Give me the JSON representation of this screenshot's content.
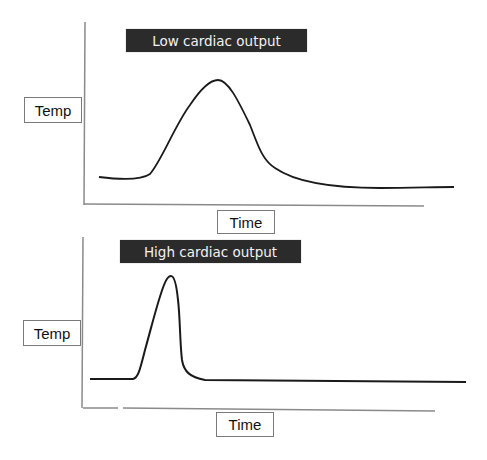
{
  "panels": [
    {
      "title": "Low cardiac output",
      "ylabel": "Temp",
      "xlabel": "Time",
      "curve": {
        "description": "broad, low, delayed thermodilution curve",
        "points": [
          [
            0.0,
            0.27
          ],
          [
            0.13,
            0.26
          ],
          [
            0.18,
            0.32
          ],
          [
            0.25,
            0.62
          ],
          [
            0.33,
            0.95
          ],
          [
            0.36,
            0.97
          ],
          [
            0.41,
            0.8
          ],
          [
            0.47,
            0.42
          ],
          [
            0.55,
            0.24
          ],
          [
            0.7,
            0.17
          ],
          [
            1.0,
            0.17
          ]
        ]
      }
    },
    {
      "title": "High cardiac output",
      "ylabel": "Temp",
      "xlabel": "Time",
      "curve": {
        "description": "narrow, tall, early thermodilution curve",
        "points": [
          [
            0.0,
            0.18
          ],
          [
            0.12,
            0.18
          ],
          [
            0.15,
            0.3
          ],
          [
            0.2,
            0.75
          ],
          [
            0.22,
            0.96
          ],
          [
            0.235,
            0.96
          ],
          [
            0.25,
            0.7
          ],
          [
            0.27,
            0.22
          ],
          [
            0.31,
            0.17
          ],
          [
            1.0,
            0.16
          ]
        ]
      }
    }
  ],
  "colors": {
    "title_bg": "#2b2b2b",
    "title_text": "#f2f2f2",
    "curve": "#1a1a1a",
    "axis": "#8a8a8a"
  }
}
